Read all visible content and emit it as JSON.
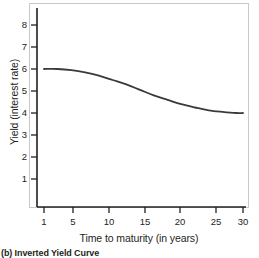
{
  "caption": "(b) Inverted Yield Curve",
  "chart_data": {
    "type": "line",
    "title": "",
    "subtitle": "",
    "xlabel": "Time to maturity (in years)",
    "ylabel": "Yield (interest rate)",
    "xlim": [
      0,
      32
    ],
    "ylim": [
      0,
      8.6
    ],
    "xticks": [
      1,
      5,
      10,
      15,
      20,
      25,
      30
    ],
    "xtick_labels": [
      "1",
      "5",
      "10",
      "15",
      "20",
      "25",
      "30"
    ],
    "yticks": [
      1,
      2,
      3,
      4,
      5,
      6,
      7,
      8
    ],
    "ytick_labels": [
      "1",
      "2",
      "3",
      "4",
      "5",
      "6",
      "7",
      "8"
    ],
    "grid": false,
    "legend": null,
    "series": [
      {
        "name": "Inverted yield curve",
        "color": "#3a3a3a",
        "linewidth": 1.8,
        "x": [
          1,
          3,
          5,
          7,
          9,
          11,
          13,
          15,
          17,
          19,
          21,
          23,
          25,
          27,
          29,
          30
        ],
        "y": [
          6.0,
          6.0,
          5.95,
          5.85,
          5.7,
          5.5,
          5.3,
          5.05,
          4.8,
          4.6,
          4.4,
          4.25,
          4.12,
          4.05,
          4.0,
          4.0
        ]
      }
    ],
    "annotations": []
  }
}
